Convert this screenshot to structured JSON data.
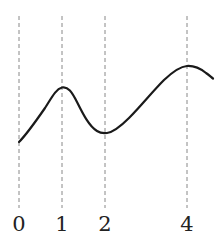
{
  "figure": {
    "background_color": "#ffffff",
    "width": 222,
    "height": 243,
    "name": "function-curve-with-dashed-gridlines"
  },
  "chart_data": {
    "type": "line",
    "title": "",
    "subtitle": "",
    "xlabel": "",
    "ylabel": "",
    "grid": true,
    "grid_style": "dashed-vertical-only",
    "legend": null,
    "legend_position": "none",
    "axis_visible": false,
    "xlim": [
      0,
      4.6
    ],
    "ylim": [
      0,
      1
    ],
    "xtick_labels": [
      "0",
      "1",
      "2",
      "4"
    ],
    "xtick_values": [
      0,
      1,
      2,
      4
    ],
    "ytick_labels": [],
    "annotations": [],
    "series": [
      {
        "name": "curve",
        "color": "#1a1a1a",
        "line_width": 2,
        "x": [
          0,
          0.25,
          0.5,
          0.75,
          1,
          1.25,
          1.5,
          1.75,
          2,
          2.4,
          2.8,
          3.2,
          3.6,
          4,
          4.35,
          4.6
        ],
        "y": [
          0.345,
          0.46,
          0.6,
          0.692,
          0.715,
          0.693,
          0.6,
          0.49,
          0.43,
          0.44,
          0.52,
          0.64,
          0.76,
          0.845,
          0.84,
          0.81
        ]
      }
    ],
    "key_points": [
      {
        "label": "start",
        "x": 0,
        "y": 0.345
      },
      {
        "label": "local-maximum",
        "x": 1,
        "y": 0.715
      },
      {
        "label": "local-minimum",
        "x": 2,
        "y": 0.43
      },
      {
        "label": "global-maximum",
        "x": 4,
        "y": 0.845
      },
      {
        "label": "end",
        "x": 4.6,
        "y": 0.81
      }
    ]
  },
  "gridlines": {
    "color": "#888888",
    "width": 1,
    "dash": "4 3",
    "top_y": 16,
    "bottom_y": 208,
    "items": [
      {
        "label": "0",
        "x": 19
      },
      {
        "label": "1",
        "x": 62
      },
      {
        "label": "2",
        "x": 105
      },
      {
        "label": "4",
        "x": 187
      }
    ]
  },
  "ticks": {
    "color": "#222222",
    "font_size": 21,
    "baseline_y": 231,
    "labels": [
      {
        "text": "0",
        "x": 19
      },
      {
        "text": "1",
        "x": 62
      },
      {
        "text": "2",
        "x": 105
      },
      {
        "text": "4",
        "x": 187
      }
    ]
  },
  "curve": {
    "color": "#1a1a1a",
    "width": 2.2,
    "path": "M 19 142 C 27 134 36 121 45 108 C 52 97 56 89 62 87.5 C 68 86 72 92 77 102 C 83 114 89 126 97 131 C 100 133 103 133.5 107 133 C 114 132 121 126 129 118 C 141 106 152 92 164 80 C 173 71.5 180 66.5 187 66 C 194 65.6 201 69 206 73 C 209 75 211 77 213 78.5"
  }
}
